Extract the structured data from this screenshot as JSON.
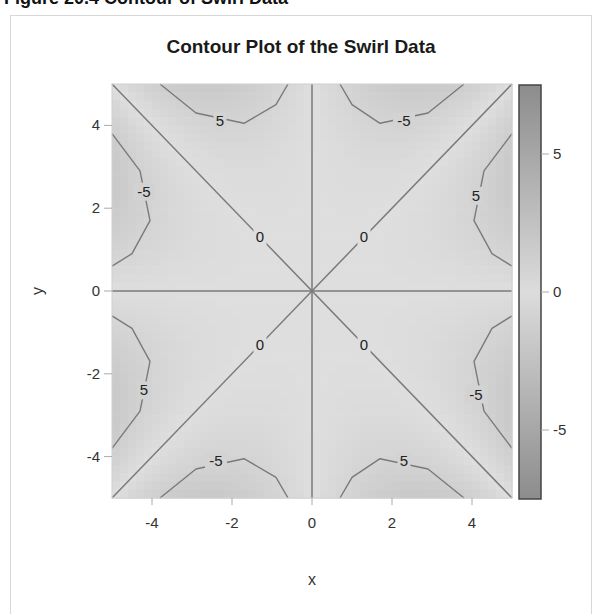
{
  "caption": "Figure 20.4 Contour of Swirl Data",
  "chart_data": {
    "type": "heatmap",
    "subtype": "contour",
    "title": "Contour Plot of the Swirl Data",
    "xlabel": "x",
    "ylabel": "y",
    "xlim": [
      -5,
      5
    ],
    "ylim": [
      -5,
      5
    ],
    "xticks": [
      -4,
      -2,
      0,
      2,
      4
    ],
    "yticks": [
      -4,
      -2,
      0,
      2,
      4
    ],
    "colorbar": {
      "range": [
        -7.5,
        7.5
      ],
      "ticks": [
        5,
        0,
        -5
      ],
      "colors": {
        "low": "#8c8c8c",
        "mid": "#dcdcdc",
        "high": "#8c8c8c"
      }
    },
    "contour_levels": [
      -5,
      0,
      5
    ],
    "zero_lines": [
      "x = 0",
      "y = 0",
      "y = x",
      "y = -x"
    ],
    "contour_labels": [
      {
        "text": "5",
        "x": -2.3,
        "y": 4.1
      },
      {
        "text": "-5",
        "x": 2.3,
        "y": 4.1
      },
      {
        "text": "-5",
        "x": -4.2,
        "y": 2.4
      },
      {
        "text": "5",
        "x": 4.1,
        "y": 2.3
      },
      {
        "text": "0",
        "x": -1.3,
        "y": 1.3
      },
      {
        "text": "0",
        "x": 1.3,
        "y": 1.3
      },
      {
        "text": "0",
        "x": -1.3,
        "y": -1.3
      },
      {
        "text": "0",
        "x": 1.3,
        "y": -1.3
      },
      {
        "text": "5",
        "x": -4.2,
        "y": -2.4
      },
      {
        "text": "-5",
        "x": 4.1,
        "y": -2.5
      },
      {
        "text": "-5",
        "x": -2.4,
        "y": -4.1
      },
      {
        "text": "5",
        "x": 2.3,
        "y": -4.1
      }
    ],
    "regions": [
      {
        "sector": "top-left upper",
        "sign": "+",
        "peak_near": [
          -2,
          4.8
        ]
      },
      {
        "sector": "top-right upper",
        "sign": "-",
        "peak_near": [
          2,
          4.8
        ]
      },
      {
        "sector": "left upper",
        "sign": "-",
        "peak_near": [
          -4.8,
          2
        ]
      },
      {
        "sector": "right upper",
        "sign": "+",
        "peak_near": [
          4.8,
          2
        ]
      },
      {
        "sector": "left lower",
        "sign": "+",
        "peak_near": [
          -4.8,
          -2
        ]
      },
      {
        "sector": "right lower",
        "sign": "-",
        "peak_near": [
          4.8,
          -2
        ]
      },
      {
        "sector": "bottom-left",
        "sign": "-",
        "peak_near": [
          -2,
          -4.8
        ]
      },
      {
        "sector": "bottom-right",
        "sign": "+",
        "peak_near": [
          2,
          -4.8
        ]
      }
    ],
    "grid": false,
    "legend": "colorbar right"
  }
}
